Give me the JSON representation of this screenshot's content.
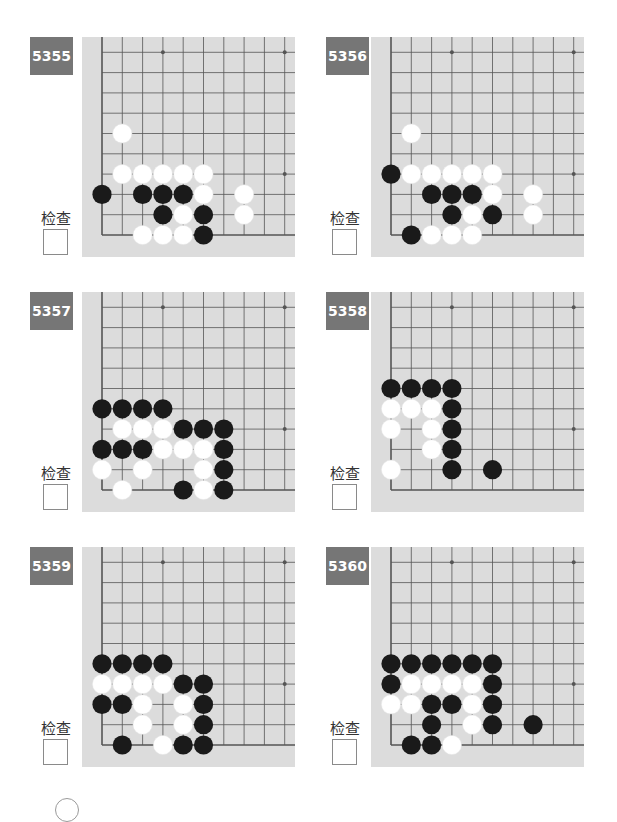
{
  "check_label": "检查",
  "board_style": {
    "background": "#dcdcdc",
    "line_color": "#555555",
    "black_stone": "#1a1a1a",
    "white_stone": "#ffffff",
    "badge_color": "#767676"
  },
  "board_geometry": {
    "origin_x": 20,
    "origin_y": 198,
    "spacing": 20.3,
    "cols": 10,
    "rows": 10,
    "star_points": [
      [
        3,
        9
      ],
      [
        9,
        9
      ],
      [
        9,
        3
      ]
    ]
  },
  "problems": [
    {
      "id": "5355",
      "black": [
        [
          0,
          2
        ],
        [
          2,
          2
        ],
        [
          3,
          2
        ],
        [
          4,
          2
        ],
        [
          3,
          1
        ],
        [
          5,
          1
        ],
        [
          5,
          0
        ]
      ],
      "white": [
        [
          1,
          5
        ],
        [
          1,
          3
        ],
        [
          2,
          3
        ],
        [
          3,
          3
        ],
        [
          4,
          3
        ],
        [
          5,
          3
        ],
        [
          5,
          2
        ],
        [
          7,
          2
        ],
        [
          4,
          1
        ],
        [
          7,
          1
        ],
        [
          2,
          0
        ],
        [
          3,
          0
        ],
        [
          4,
          0
        ]
      ]
    },
    {
      "id": "5356",
      "black": [
        [
          0,
          3
        ],
        [
          2,
          2
        ],
        [
          3,
          2
        ],
        [
          4,
          2
        ],
        [
          3,
          1
        ],
        [
          5,
          1
        ],
        [
          1,
          0
        ]
      ],
      "white": [
        [
          1,
          5
        ],
        [
          1,
          3
        ],
        [
          2,
          3
        ],
        [
          3,
          3
        ],
        [
          4,
          3
        ],
        [
          5,
          3
        ],
        [
          5,
          2
        ],
        [
          7,
          2
        ],
        [
          4,
          1
        ],
        [
          7,
          1
        ],
        [
          2,
          0
        ],
        [
          3,
          0
        ],
        [
          4,
          0
        ]
      ]
    },
    {
      "id": "5357",
      "black": [
        [
          0,
          4
        ],
        [
          1,
          4
        ],
        [
          2,
          4
        ],
        [
          3,
          4
        ],
        [
          4,
          3
        ],
        [
          5,
          3
        ],
        [
          6,
          3
        ],
        [
          0,
          2
        ],
        [
          1,
          2
        ],
        [
          2,
          2
        ],
        [
          6,
          2
        ],
        [
          6,
          1
        ],
        [
          4,
          0
        ],
        [
          6,
          0
        ]
      ],
      "white": [
        [
          1,
          3
        ],
        [
          2,
          3
        ],
        [
          3,
          3
        ],
        [
          3,
          2
        ],
        [
          4,
          2
        ],
        [
          5,
          2
        ],
        [
          0,
          1
        ],
        [
          2,
          1
        ],
        [
          5,
          1
        ],
        [
          1,
          0
        ],
        [
          5,
          0
        ]
      ]
    },
    {
      "id": "5358",
      "black": [
        [
          0,
          5
        ],
        [
          1,
          5
        ],
        [
          2,
          5
        ],
        [
          3,
          5
        ],
        [
          3,
          4
        ],
        [
          3,
          3
        ],
        [
          3,
          2
        ],
        [
          3,
          1
        ],
        [
          5,
          1
        ]
      ],
      "white": [
        [
          0,
          4
        ],
        [
          1,
          4
        ],
        [
          2,
          4
        ],
        [
          0,
          3
        ],
        [
          2,
          3
        ],
        [
          2,
          2
        ],
        [
          0,
          1
        ]
      ]
    },
    {
      "id": "5359",
      "black": [
        [
          0,
          4
        ],
        [
          1,
          4
        ],
        [
          2,
          4
        ],
        [
          3,
          4
        ],
        [
          4,
          3
        ],
        [
          5,
          3
        ],
        [
          0,
          2
        ],
        [
          1,
          2
        ],
        [
          5,
          2
        ],
        [
          5,
          1
        ],
        [
          1,
          0
        ],
        [
          4,
          0
        ],
        [
          5,
          0
        ]
      ],
      "white": [
        [
          0,
          3
        ],
        [
          1,
          3
        ],
        [
          2,
          3
        ],
        [
          3,
          3
        ],
        [
          2,
          2
        ],
        [
          4,
          2
        ],
        [
          2,
          1
        ],
        [
          4,
          1
        ],
        [
          3,
          0
        ]
      ]
    },
    {
      "id": "5360",
      "black": [
        [
          0,
          4
        ],
        [
          1,
          4
        ],
        [
          2,
          4
        ],
        [
          3,
          4
        ],
        [
          4,
          4
        ],
        [
          5,
          4
        ],
        [
          0,
          3
        ],
        [
          5,
          3
        ],
        [
          2,
          2
        ],
        [
          3,
          2
        ],
        [
          5,
          2
        ],
        [
          2,
          1
        ],
        [
          5,
          1
        ],
        [
          7,
          1
        ],
        [
          1,
          0
        ],
        [
          2,
          0
        ]
      ],
      "white": [
        [
          1,
          3
        ],
        [
          2,
          3
        ],
        [
          3,
          3
        ],
        [
          4,
          3
        ],
        [
          0,
          2
        ],
        [
          1,
          2
        ],
        [
          4,
          2
        ],
        [
          4,
          1
        ],
        [
          3,
          0
        ]
      ]
    }
  ]
}
